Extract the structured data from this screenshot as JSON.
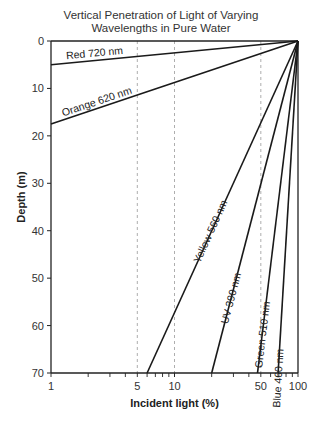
{
  "chart_data": {
    "type": "line",
    "title": "Vertical Penetration of Light of Varying Wavelengths in Pure Water",
    "title_lines": [
      "Vertical Penetration of Light of Varying",
      "Wavelengths in Pure Water"
    ],
    "xlabel": "Incident light (%)",
    "ylabel": "Depth (m)",
    "xscale": "log",
    "xlim": [
      1,
      100
    ],
    "ylim": [
      70,
      0
    ],
    "x_tick_labels": [
      "1",
      "5",
      "10",
      "50",
      "100"
    ],
    "y_tick_labels": [
      "0",
      "10",
      "20",
      "30",
      "40",
      "50",
      "60",
      "70"
    ],
    "reference_gridlines_x": [
      5,
      10,
      50
    ],
    "grid": "dashed vertical lines at 5, 10, 50",
    "series": [
      {
        "name": "Red 720 nm",
        "points": [
          [
            100,
            0
          ],
          [
            1,
            5
          ]
        ]
      },
      {
        "name": "Orange 620 nm",
        "points": [
          [
            100,
            0
          ],
          [
            1,
            17.5
          ]
        ]
      },
      {
        "name": "Yellow 560 nm",
        "points": [
          [
            100,
            0
          ],
          [
            6,
            70
          ]
        ]
      },
      {
        "name": "UV 390 nm",
        "points": [
          [
            100,
            0
          ],
          [
            20,
            70
          ]
        ]
      },
      {
        "name": "Green 510 nm",
        "points": [
          [
            100,
            0
          ],
          [
            47,
            70
          ]
        ]
      },
      {
        "name": "Blue 460 nm",
        "points": [
          [
            100,
            0
          ],
          [
            69,
            70
          ]
        ]
      }
    ]
  }
}
